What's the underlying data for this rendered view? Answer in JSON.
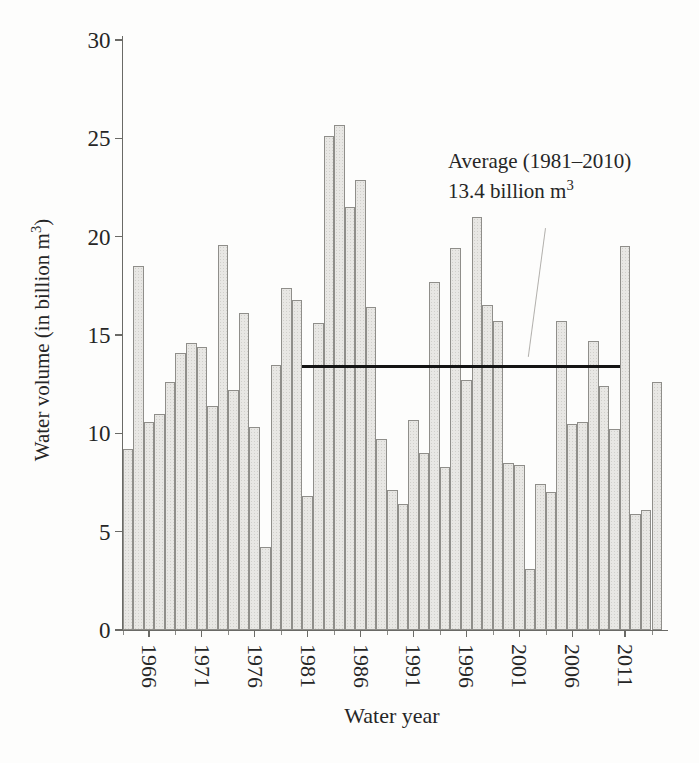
{
  "figure": {
    "background": "#fdfdfc",
    "bar_fill": "#e8e7e4",
    "bar_border": "#8f8e8a",
    "axis_color": "#6a6a66",
    "average_line_color": "#141414",
    "text_color": "#262626"
  },
  "chart_data": {
    "type": "bar",
    "title": "",
    "xlabel": "Water year",
    "ylabel": "Water volume (in billion m³)",
    "ylabel_pre": "Water volume (in billion m",
    "ylabel_sup": "3",
    "ylabel_post": ")",
    "ylim": [
      0,
      30
    ],
    "y_ticks": [
      0,
      5,
      10,
      15,
      20,
      25,
      30
    ],
    "x_tick_years": [
      1966,
      1971,
      1976,
      1981,
      1986,
      1991,
      1996,
      2001,
      2006,
      2011
    ],
    "grid": "off",
    "years": [
      1964,
      1965,
      1966,
      1967,
      1968,
      1969,
      1970,
      1971,
      1972,
      1973,
      1974,
      1975,
      1976,
      1977,
      1978,
      1979,
      1980,
      1981,
      1982,
      1983,
      1984,
      1985,
      1986,
      1987,
      1988,
      1989,
      1990,
      1991,
      1992,
      1993,
      1994,
      1995,
      1996,
      1997,
      1998,
      1999,
      2000,
      2001,
      2002,
      2003,
      2004,
      2005,
      2006,
      2007,
      2008,
      2009,
      2010,
      2011,
      2012,
      2013,
      2014
    ],
    "values": [
      9.2,
      18.5,
      10.6,
      11.0,
      12.6,
      14.1,
      14.6,
      14.4,
      11.4,
      19.6,
      12.2,
      16.1,
      10.3,
      4.2,
      13.5,
      17.4,
      16.8,
      6.8,
      15.6,
      25.1,
      25.7,
      21.5,
      22.9,
      16.4,
      9.7,
      7.1,
      6.4,
      10.7,
      9.0,
      17.7,
      8.3,
      19.4,
      12.7,
      21.0,
      16.5,
      15.7,
      8.5,
      8.4,
      3.1,
      7.4,
      7.0,
      15.7,
      10.5,
      10.6,
      14.7,
      12.4,
      10.2,
      19.5,
      5.9,
      6.1,
      12.6
    ],
    "average": {
      "value": 13.4,
      "start_year": 1981,
      "end_year": 2010,
      "label_line1": "Average (1981–2010)",
      "label_line2": "13.4 billion m³",
      "label_line2_pre": "13.4 billion m",
      "label_line2_sup": "3"
    }
  }
}
